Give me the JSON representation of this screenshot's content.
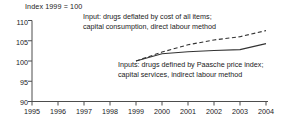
{
  "chart_data": {
    "type": "line",
    "title": "",
    "subtitle": "",
    "axis_unit_label": "Index 1999 = 100",
    "xlabel": "",
    "ylabel": "",
    "ylim": [
      90,
      110
    ],
    "xlim": [
      1995,
      2004
    ],
    "grid": false,
    "legend_position": "annotations-inline",
    "x_tick_labels": [
      "1995",
      "1996",
      "1997",
      "1998",
      "1999",
      "2000",
      "2001",
      "2002",
      "2003",
      "2004"
    ],
    "y_tick_labels": [
      "110",
      "105",
      "100",
      "95",
      "90"
    ],
    "y_tick_values": [
      110,
      105,
      100,
      95,
      90
    ],
    "x": [
      1999,
      2000,
      2001,
      2002,
      2003,
      2004
    ],
    "series": [
      {
        "name": "Input: drugs deflated by cost of all items; capital consumption, direct labour method",
        "style": "dashed",
        "color": "#333333",
        "values": [
          100.0,
          102.2,
          104.0,
          105.2,
          106.0,
          107.5
        ]
      },
      {
        "name": "Inputs: drugs defined by Paasche price index; capital services, indirect labour method",
        "style": "solid",
        "color": "#333333",
        "values": [
          100.0,
          101.8,
          102.3,
          102.6,
          102.8,
          104.3
        ]
      }
    ],
    "annotations": [
      {
        "id": "upper",
        "lines": [
          "Input: drugs deflated by cost of all items;",
          "capital consumption, direct labour method"
        ]
      },
      {
        "id": "lower",
        "lines": [
          "Inputs: drugs defined by Paasche price index;",
          "capital services, indirect labour method"
        ]
      }
    ]
  },
  "colors": {
    "axis": "#4d4d4d",
    "text": "#1a1a1a",
    "series_line": "#333333",
    "background": "#ffffff"
  }
}
